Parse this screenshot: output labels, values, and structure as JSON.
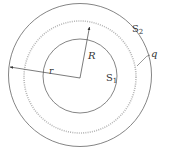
{
  "diagram": {
    "labels": {
      "outer_surface": "S",
      "outer_surface_sub": "2",
      "inner_surface": "S",
      "inner_surface_sub": "1",
      "charge": "q",
      "big_radius": "R",
      "small_radius": "r"
    },
    "colors": {
      "line": "#555555",
      "charge_ring": "#aaaaaa"
    }
  }
}
